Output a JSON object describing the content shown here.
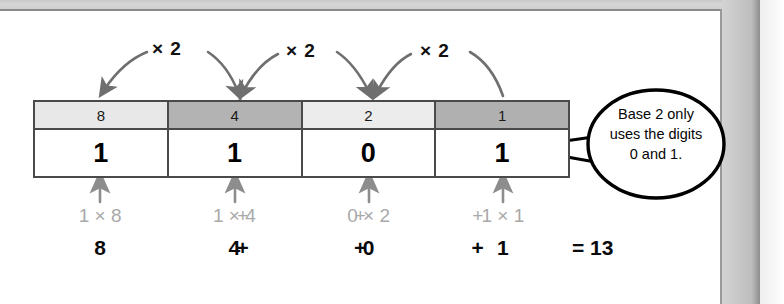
{
  "diagram": {
    "multiplier_labels": [
      "× 2",
      "× 2",
      "× 2"
    ],
    "table": {
      "place_values": [
        "8",
        "4",
        "2",
        "1"
      ],
      "digits": [
        "1",
        "1",
        "0",
        "1"
      ],
      "header_shades": [
        "#e8e8e8",
        "#b3b3b3",
        "#ececec",
        "#b0b0b0"
      ]
    },
    "terms_row": [
      "1 × 8",
      "1 × 4",
      "0 × 2",
      "1 × 1"
    ],
    "term_operators": [
      "+",
      "+",
      "+"
    ],
    "sums_row": [
      "8",
      "4",
      "0",
      "1"
    ],
    "sum_operators": [
      "+",
      "+",
      "+"
    ],
    "total": "= 13",
    "callout": {
      "line1": "Base 2 only",
      "line2": "uses the digits",
      "line3": "0 and 1."
    }
  },
  "colors": {
    "ink": "#0a0a0a",
    "muted": "#a9a9a9",
    "rule": "#4a4a4a",
    "arrow": "#6f6f6f"
  }
}
